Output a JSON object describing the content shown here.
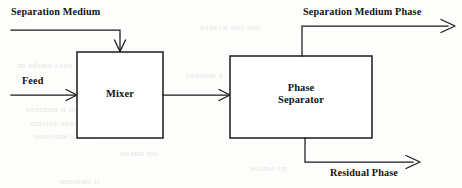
{
  "diagram": {
    "type": "process-flow-diagram",
    "colors": {
      "line": "#1b1b1b",
      "background": "#fdfdfc",
      "text": "#131313"
    },
    "units": [
      {
        "id": "mixer",
        "label": "Mixer",
        "lines": [
          "Mixer"
        ],
        "x": 77,
        "y": 52,
        "width": 86,
        "height": 86
      },
      {
        "id": "phase-separator",
        "label": "Phase Separator",
        "lines": [
          "Phase",
          "Separator"
        ],
        "x": 230,
        "y": 56,
        "width": 142,
        "height": 82
      }
    ],
    "streams": [
      {
        "id": "separation-medium",
        "label": "Separation Medium",
        "kind": "inlet",
        "direction": "down",
        "target": "mixer"
      },
      {
        "id": "feed",
        "label": "Feed",
        "kind": "inlet",
        "direction": "right",
        "target": "mixer"
      },
      {
        "id": "mixer-to-separator",
        "label": "",
        "kind": "internal",
        "direction": "right",
        "source": "mixer",
        "target": "phase-separator"
      },
      {
        "id": "separation-medium-phase",
        "label": "Separation Medium Phase",
        "kind": "outlet",
        "direction": "right",
        "source": "phase-separator"
      },
      {
        "id": "residual-phase",
        "label": "Residual Phase",
        "kind": "outlet",
        "direction": "right",
        "source": "phase-separator"
      }
    ],
    "background_bleed": [
      {
        "text": "m sdeno tvaa",
        "x": 18,
        "y": 60
      },
      {
        "text": "aaaecn ooi atn",
        "x": 200,
        "y": 22
      },
      {
        "text": "seotmm n oseeta",
        "x": 26,
        "y": 104
      },
      {
        "text": "nmrtoi aaeo c",
        "x": 30,
        "y": 118
      },
      {
        "text": "smeotne a ort",
        "x": 34,
        "y": 131
      },
      {
        "text": "eoann mt",
        "x": 120,
        "y": 148
      },
      {
        "text": "aotme rn",
        "x": 250,
        "y": 163
      },
      {
        "text": "mnseao ti",
        "x": 60,
        "y": 176
      },
      {
        "text": "eas ont",
        "x": 330,
        "y": 117
      },
      {
        "text": "tnoaem s",
        "x": 186,
        "y": 70
      }
    ]
  }
}
